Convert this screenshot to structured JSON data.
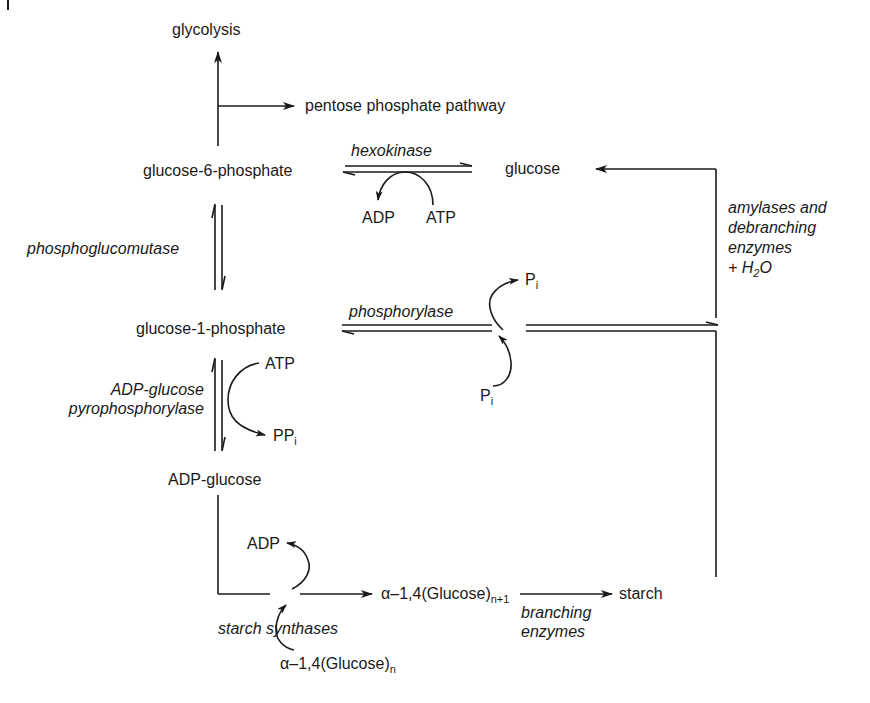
{
  "diagram": {
    "type": "metabolic pathway",
    "nodes": {
      "glycolysis": "glycolysis",
      "pentose": "pentose phosphate pathway",
      "g6p": "glucose-6-phosphate",
      "glucose": "glucose",
      "g1p": "glucose-1-phosphate",
      "adpglucose": "ADP-glucose",
      "glucan_n1_base": "α–1,4(Glucose)",
      "glucan_n1_sub": "n+1",
      "glucan_n_base": "α–1,4(Glucose)",
      "glucan_n_sub": "n",
      "starch": "starch"
    },
    "enzymes": {
      "hexokinase": "hexokinase",
      "phosphoglucomutase": "phosphoglucomutase",
      "phosphorylase": "phosphorylase",
      "adpgp_line1": "ADP-glucose",
      "adpgp_line2": "pyrophosphorylase",
      "amylases_line1": "amylases and",
      "amylases_line2": "debranching",
      "amylases_line3": "enzymes",
      "amylases_line4_prefix": "+ H",
      "amylases_line4_sub": "2",
      "amylases_line4_suffix": "O",
      "starch_synthases": "starch synthases",
      "branching_line1": "branching",
      "branching_line2": "enzymes"
    },
    "cofactors": {
      "hk_adp": "ADP",
      "hk_atp": "ATP",
      "pi_top_base": "P",
      "pi_top_sub": "i",
      "pi_bottom_base": "P",
      "pi_bottom_sub": "i",
      "agp_atp": "ATP",
      "ppi_base": "PP",
      "ppi_sub": "i",
      "ss_adp": "ADP"
    },
    "edges": [
      {
        "from": "glucose-6-phosphate",
        "to": "glycolysis",
        "type": "irreversible"
      },
      {
        "from": "glucose-6-phosphate",
        "to": "pentose phosphate pathway",
        "type": "irreversible"
      },
      {
        "from": "glucose",
        "to": "glucose-6-phosphate",
        "enzyme": "hexokinase",
        "type": "reversible"
      },
      {
        "from": "glucose-6-phosphate",
        "to": "glucose-1-phosphate",
        "enzyme": "phosphoglucomutase",
        "type": "reversible"
      },
      {
        "from": "starch",
        "to": "glucose-1-phosphate",
        "enzyme": "phosphorylase",
        "type": "reversible"
      },
      {
        "from": "starch",
        "to": "glucose",
        "enzyme": "amylases and debranching enzymes + H2O",
        "type": "irreversible"
      },
      {
        "from": "glucose-1-phosphate",
        "to": "ADP-glucose",
        "enzyme": "ADP-glucose pyrophosphorylase",
        "type": "reversible"
      },
      {
        "from": "ADP-glucose",
        "to": "α-1,4(Glucose)n+1",
        "enzyme": "starch synthases",
        "type": "irreversible"
      },
      {
        "from": "α-1,4(Glucose)n+1",
        "to": "starch",
        "enzyme": "branching enzymes",
        "type": "irreversible"
      }
    ]
  }
}
